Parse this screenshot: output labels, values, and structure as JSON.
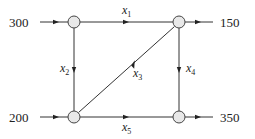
{
  "diagram": {
    "type": "network-flow",
    "nodes": [
      {
        "id": "top-left",
        "cx": 74,
        "cy": 22
      },
      {
        "id": "top-right",
        "cx": 179,
        "cy": 22
      },
      {
        "id": "bottom-left",
        "cx": 74,
        "cy": 117
      },
      {
        "id": "bottom-right",
        "cx": 179,
        "cy": 117
      }
    ],
    "external_flows": {
      "inflow_top_left": "300",
      "outflow_top_right": "150",
      "inflow_bottom_left": "200",
      "outflow_bottom_right": "350"
    },
    "edges": {
      "x1": {
        "var": "x",
        "sub": "1",
        "from": "top-left",
        "to": "top-right"
      },
      "x2": {
        "var": "x",
        "sub": "2",
        "from": "top-left",
        "to": "bottom-left"
      },
      "x3": {
        "var": "x",
        "sub": "3",
        "from": "bottom-left",
        "to": "top-right"
      },
      "x4": {
        "var": "x",
        "sub": "4",
        "from": "top-right",
        "to": "bottom-right"
      },
      "x5": {
        "var": "x",
        "sub": "5",
        "from": "bottom-left",
        "to": "bottom-right"
      }
    },
    "colors": {
      "node_fill": "#e8e8e8",
      "stroke": "#333333",
      "text": "#222222"
    }
  }
}
